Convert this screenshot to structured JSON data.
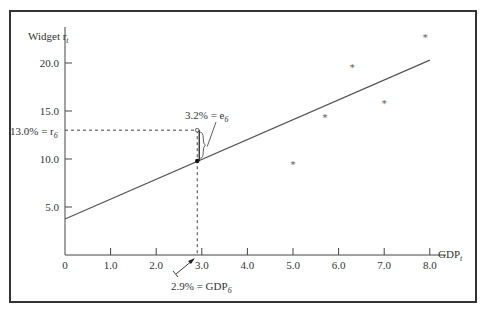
{
  "chart_data": {
    "type": "scatter",
    "title": "",
    "xlabel": "GDP",
    "xlabel_subscript": "t",
    "ylabel": "Widget r",
    "ylabel_subscript": "t",
    "xlim": [
      0,
      8.2
    ],
    "ylim": [
      0,
      23
    ],
    "grid": false,
    "x_ticks": [
      0,
      1.0,
      2.0,
      3.0,
      4.0,
      5.0,
      6.0,
      7.0,
      8.0
    ],
    "x_tick_labels": [
      "0",
      "1.0",
      "2.0",
      "3.0",
      "4.0",
      "5.0",
      "6.0",
      "7.0",
      "8.0"
    ],
    "y_ticks": [
      5.0,
      10.0,
      15.0,
      20.0
    ],
    "y_tick_labels": [
      "5.0",
      "10.0",
      "15.0",
      "20.0"
    ],
    "points": [
      {
        "x": 2.9,
        "y": 13.0,
        "marker": "open-circle"
      },
      {
        "x": 5.0,
        "y": 9.5,
        "marker": "asterisk"
      },
      {
        "x": 5.7,
        "y": 14.4,
        "marker": "asterisk"
      },
      {
        "x": 6.3,
        "y": 19.6,
        "marker": "asterisk"
      },
      {
        "x": 7.0,
        "y": 15.8,
        "marker": "asterisk"
      },
      {
        "x": 7.9,
        "y": 22.7,
        "marker": "asterisk"
      }
    ],
    "regression_line": {
      "x0": 0,
      "y0": 3.75,
      "x1": 8.0,
      "y1": 20.3
    },
    "fitted_point": {
      "x": 2.9,
      "y": 9.8
    },
    "annotations": {
      "residual": {
        "text": "3.2% = e",
        "sub": "6"
      },
      "actual": {
        "text": "13.0% = r",
        "sub": "6",
        "value": 13.0
      },
      "gdp": {
        "text": "2.9% = GDP",
        "sub": "6",
        "value": 2.9
      }
    }
  }
}
